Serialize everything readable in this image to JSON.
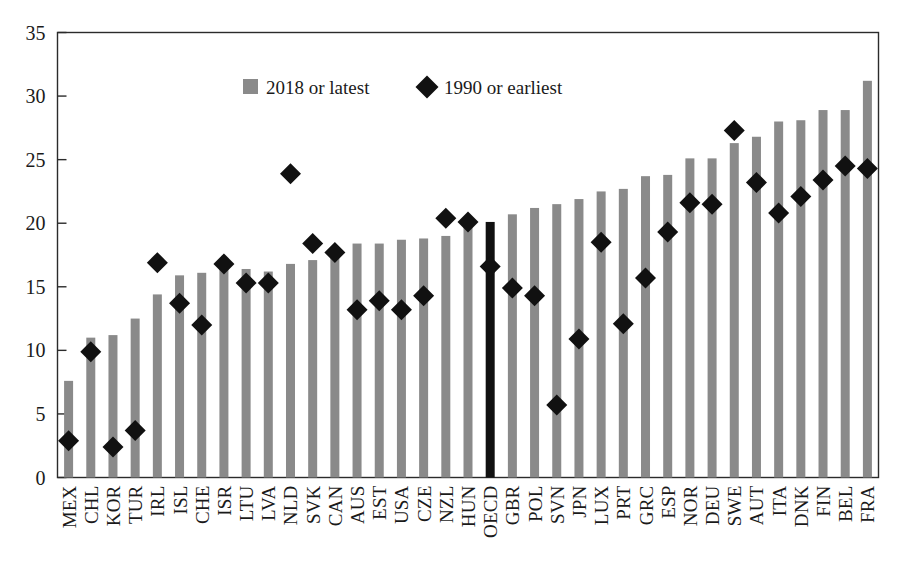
{
  "chart_data": {
    "type": "bar",
    "title": "",
    "subtitle": "",
    "xlabel": "",
    "ylabel": "",
    "ylim": [
      0,
      35
    ],
    "ytick_step": 5,
    "yticks": [
      "0",
      "5",
      "10",
      "15",
      "20",
      "25",
      "30",
      "35"
    ],
    "grid": false,
    "legend_position": "top-center",
    "legend": [
      {
        "label": "2018 or latest",
        "marker": "square",
        "color": "#8a8a8a"
      },
      {
        "label": "1990 or earliest",
        "marker": "diamond",
        "color": "#111111"
      }
    ],
    "categories": [
      "MEX",
      "CHL",
      "KOR",
      "TUR",
      "IRL",
      "ISL",
      "CHE",
      "ISR",
      "LTU",
      "LVA",
      "NLD",
      "SVK",
      "CAN",
      "AUS",
      "EST",
      "USA",
      "CZE",
      "NZL",
      "HUN",
      "OECD",
      "GBR",
      "POL",
      "SVN",
      "JPN",
      "LUX",
      "PRT",
      "GRC",
      "ESP",
      "NOR",
      "DEU",
      "SWE",
      "AUT",
      "ITA",
      "DNK",
      "FIN",
      "BEL",
      "FRA"
    ],
    "highlight_category": "OECD",
    "highlight_color": "#111111",
    "series": [
      {
        "name": "2018 or latest",
        "marker": "bar",
        "color": "#8a8a8a",
        "values": [
          7.6,
          11.0,
          11.2,
          12.5,
          14.4,
          15.9,
          16.1,
          16.8,
          16.4,
          16.2,
          16.8,
          17.1,
          17.7,
          18.4,
          18.4,
          18.7,
          18.8,
          19.0,
          19.9,
          20.1,
          20.7,
          21.2,
          21.5,
          21.9,
          22.5,
          22.7,
          23.7,
          23.8,
          25.1,
          25.1,
          26.3,
          26.8,
          28.0,
          28.1,
          28.9,
          28.9,
          31.2
        ]
      },
      {
        "name": "1990 or earliest",
        "marker": "diamond",
        "color": "#111111",
        "values": [
          2.9,
          9.9,
          2.4,
          3.7,
          16.9,
          13.7,
          12.0,
          16.8,
          15.3,
          15.3,
          23.9,
          18.4,
          17.7,
          13.2,
          13.9,
          13.2,
          14.3,
          20.4,
          20.1,
          16.6,
          14.9,
          14.3,
          5.7,
          10.9,
          18.5,
          12.1,
          15.7,
          19.3,
          21.6,
          21.5,
          27.3,
          23.2,
          20.8,
          22.1,
          23.4,
          24.5,
          24.3
        ]
      }
    ]
  }
}
